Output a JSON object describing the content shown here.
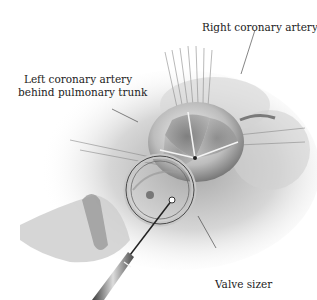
{
  "figure": {
    "type": "surgical illustration",
    "colors": {
      "background": "#ffffff",
      "ink": "#222222",
      "tissue_light": "#e6e6e6",
      "tissue_mid": "#b5b5b5",
      "tissue_dark": "#5a5a5a"
    }
  },
  "labels": {
    "right_coronary": "Right coronary artery",
    "left_coronary_line1": "Left coronary artery",
    "left_coronary_line2": "behind pulmonary trunk",
    "valve_sizer": "Valve sizer"
  }
}
